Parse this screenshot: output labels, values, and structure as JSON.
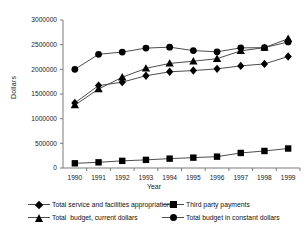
{
  "chart_data": {
    "type": "line",
    "title": "",
    "xlabel": "Year",
    "ylabel": "Dollars",
    "categories": [
      "1990",
      "1991",
      "1992",
      "1993",
      "1994",
      "1995",
      "1996",
      "1997",
      "1998",
      "1999"
    ],
    "ylim": [
      0,
      3000000
    ],
    "xlim_labels": [
      "1990",
      "1999"
    ],
    "ytick_labels": [
      "0",
      "500000",
      "1000000",
      "1500000",
      "2000000",
      "2500000",
      "3000000"
    ],
    "yticks": [
      0,
      500000,
      1000000,
      1500000,
      2000000,
      2500000,
      3000000
    ],
    "grid": false,
    "legend_position": "bottom",
    "series": [
      {
        "name": "Total service and facilities appropriations",
        "marker": "diamond",
        "values": [
          1320000,
          1670000,
          1740000,
          1870000,
          1950000,
          1975000,
          2010000,
          2070000,
          2110000,
          2260000
        ]
      },
      {
        "name": "Third party payments",
        "marker": "square",
        "values": [
          95000,
          115000,
          145000,
          165000,
          190000,
          210000,
          230000,
          305000,
          345000,
          395000
        ]
      },
      {
        "name": "Total  budget, current dollars",
        "marker": "triangle",
        "values": [
          1275000,
          1600000,
          1840000,
          2020000,
          2120000,
          2165000,
          2215000,
          2375000,
          2440000,
          2620000
        ]
      },
      {
        "name": "Total budget in constant dollars",
        "marker": "circle",
        "values": [
          2000000,
          2305000,
          2350000,
          2430000,
          2450000,
          2380000,
          2355000,
          2435000,
          2440000,
          2555000
        ]
      }
    ]
  },
  "legend": {
    "items": [
      {
        "label": "Total service and facilities appropriations",
        "marker": "diamond"
      },
      {
        "label": "Third party payments",
        "marker": "square"
      },
      {
        "label": "Total  budget, current dollars",
        "marker": "triangle"
      },
      {
        "label": "Total budget in constant dollars",
        "marker": "circle"
      }
    ]
  },
  "colors": {
    "line": "#4d4d4d",
    "marker": "#000000",
    "axis": "#7a7a7a",
    "text": "#111111",
    "background": "#ffffff"
  }
}
